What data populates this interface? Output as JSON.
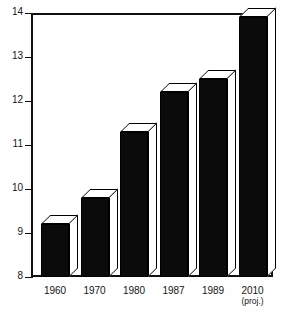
{
  "chart_data": {
    "type": "bar",
    "title": "",
    "subtitle": "",
    "xlabel": "",
    "ylabel": "",
    "categories": [
      "1960",
      "1970",
      "1980",
      "1987",
      "1989",
      "2010"
    ],
    "category_sublabels": [
      "",
      "",
      "",
      "",
      "",
      "(proj.)"
    ],
    "values": [
      9.2,
      9.8,
      11.3,
      12.2,
      12.5,
      13.9
    ],
    "ylim": [
      8,
      14
    ],
    "yticks": [
      8,
      9,
      10,
      11,
      12,
      13,
      14
    ],
    "ytick_labels": [
      "8",
      "9",
      "10",
      "11",
      "12",
      "13",
      "14"
    ],
    "grid": false,
    "legend": null,
    "style": "3d-block-bars",
    "colors": {
      "bar_face": "#0b0b0b",
      "bar_side": "#ffffff",
      "outline": "#000000",
      "axis": "#111111",
      "background": "#ffffff",
      "text": "#151515"
    }
  }
}
